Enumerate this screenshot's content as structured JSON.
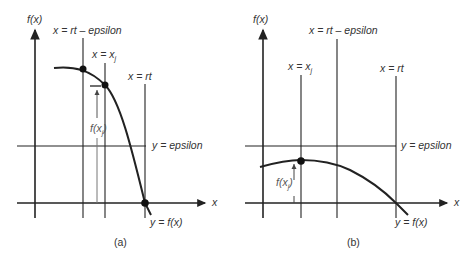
{
  "panels": [
    {
      "id": "a",
      "caption": "(a)",
      "y_axis_label": "f(x)",
      "x_axis_label": "x",
      "labels": {
        "rt_minus_eps": "x = rt – epsilon",
        "xj": "x = x",
        "xj_sub": "j",
        "rt": "x = rt",
        "eps": "y = epsilon",
        "curve": "y = f(x)",
        "fxj": "f(x",
        "fxj_sub": "j",
        "fxj_close": ")"
      }
    },
    {
      "id": "b",
      "caption": "(b)",
      "y_axis_label": "f(x)",
      "x_axis_label": "x",
      "labels": {
        "rt_minus_eps": "x = rt – epsilon",
        "xj": "x = x",
        "xj_sub": "j",
        "rt": "x = rt",
        "eps": "y = epsilon",
        "curve": "y = f(x)",
        "fxj": "f(x",
        "fxj_sub": "j",
        "fxj_close": ")"
      }
    }
  ]
}
